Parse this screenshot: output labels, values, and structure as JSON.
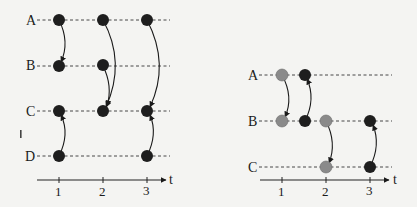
{
  "left_diagram": {
    "rows": [
      "A",
      "B",
      "C",
      "D"
    ],
    "time_ticks": [
      "1",
      "2",
      "3"
    ],
    "axis_label": "t",
    "node_color": "#1e1e1e",
    "nodes": [
      {
        "row": "A",
        "t": 1
      },
      {
        "row": "A",
        "t": 2
      },
      {
        "row": "A",
        "t": 3
      },
      {
        "row": "B",
        "t": 1
      },
      {
        "row": "B",
        "t": 2
      },
      {
        "row": "C",
        "t": 1
      },
      {
        "row": "C",
        "t": 2
      },
      {
        "row": "C",
        "t": 3
      },
      {
        "row": "D",
        "t": 1
      },
      {
        "row": "D",
        "t": 3
      }
    ],
    "edges": [
      {
        "from": "A@1",
        "to": "B@1"
      },
      {
        "from": "A@2",
        "to": "C@2"
      },
      {
        "from": "B@2",
        "to": "C@2"
      },
      {
        "from": "A@3",
        "to": "C@3"
      },
      {
        "from": "D@1",
        "to": "C@1"
      },
      {
        "from": "D@3",
        "to": "C@3"
      }
    ]
  },
  "right_diagram": {
    "rows": [
      "A",
      "B",
      "C"
    ],
    "time_ticks": [
      "1",
      "2",
      "3"
    ],
    "axis_label": "t",
    "colors": {
      "gray": "#8a8a8a",
      "black": "#1e1e1e"
    },
    "nodes": [
      {
        "row": "A",
        "t": 1,
        "color": "gray"
      },
      {
        "row": "A",
        "t": 1.5,
        "color": "black"
      },
      {
        "row": "B",
        "t": 1,
        "color": "gray"
      },
      {
        "row": "B",
        "t": 1.5,
        "color": "black"
      },
      {
        "row": "B",
        "t": 2,
        "color": "gray"
      },
      {
        "row": "B",
        "t": 3,
        "color": "black"
      },
      {
        "row": "C",
        "t": 2,
        "color": "gray"
      },
      {
        "row": "C",
        "t": 3,
        "color": "black"
      }
    ],
    "edges": [
      {
        "from": "A@1",
        "to": "B@1"
      },
      {
        "from": "B@1.5",
        "to": "A@1.5"
      },
      {
        "from": "B@2",
        "to": "C@2"
      },
      {
        "from": "C@3",
        "to": "B@3"
      }
    ]
  },
  "stray_mark": "'"
}
